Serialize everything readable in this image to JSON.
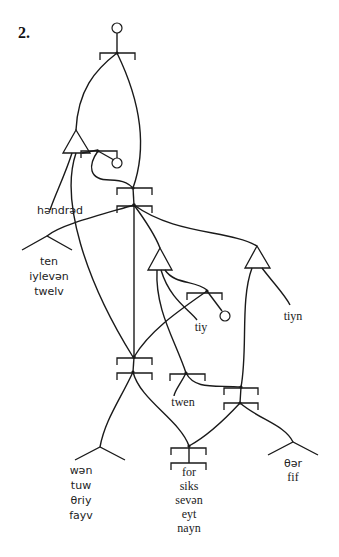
{
  "figure": {
    "number_label": "2."
  },
  "diagram": {
    "type": "relational-network",
    "labels": {
      "hundred": "həndrəd",
      "teen_group": [
        "ten",
        "iylevən",
        "twelv"
      ],
      "ty": "tiy",
      "teen": "tiyn",
      "twen": "twen",
      "ones_a": [
        "wən",
        "tuw",
        "θriy",
        "fayv"
      ],
      "ones_b": [
        "for",
        "siks",
        "sevən",
        "eyt",
        "nayn"
      ],
      "ones_c": [
        "θər",
        "fif"
      ]
    },
    "colors": {
      "line": "#1a1a1a",
      "text": "#222222",
      "background": "#ffffff"
    }
  }
}
